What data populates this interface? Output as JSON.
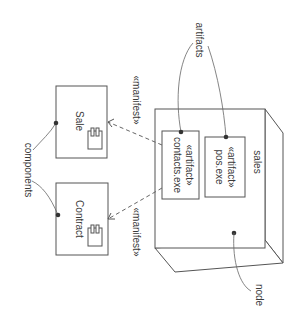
{
  "diagram": {
    "type": "UML deployment diagram (rotated 90° clockwise)",
    "node": {
      "name": "sales",
      "callout": "node"
    },
    "artifacts": [
      {
        "stereotype": "«artifact»",
        "name": "pos.exe"
      },
      {
        "stereotype": "«artifact»",
        "name": "contacts.exe"
      }
    ],
    "artifacts_callout": "artifacts",
    "components": [
      {
        "name": "Sale"
      },
      {
        "name": "Contract"
      }
    ],
    "components_callout": "components",
    "dependencies": [
      {
        "label": "«manifest»",
        "from": "contacts.exe",
        "to": "Sale"
      },
      {
        "label": "«manifest»",
        "from": "contacts.exe",
        "to": "Contract"
      }
    ],
    "colors": {
      "line": "#555555",
      "text": "#3a3a3a",
      "background": "#ffffff"
    }
  }
}
